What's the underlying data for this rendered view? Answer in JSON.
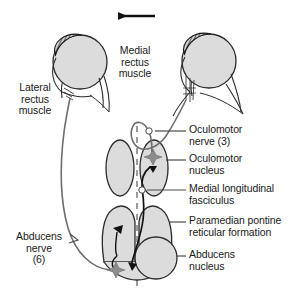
{
  "figure": {
    "gaze_direction_arrow": "leftward-arrow",
    "background_color": "#ffffff",
    "ink_color": "#1a1a1a",
    "structure_fill": "#dcdcdc",
    "structure_stroke": "#2b2b2b",
    "accent_marker_color": "#808080",
    "synapse_marker_color": "#111111"
  },
  "labels": {
    "lateral_rectus": "Lateral\nrectus\nmuscle",
    "medial_rectus": "Medial\nrectus\nmuscle",
    "oculomotor_nerve": "Oculomotor\nnerve (3)",
    "oculomotor_nucleus": "Oculomotor\nnucleus",
    "mlf": "Medial longitudinal\nfasciculus",
    "pprf": "Paramedian pontine\nreticular formation",
    "abducens_nucleus": "Abducens\nnucleus",
    "abducens_nerve": "Abducens\nnerve\n(6)"
  },
  "anatomy": {
    "eyes": [
      {
        "name": "left-eye",
        "side": "left",
        "cornea": "hatched-arc-upper-left"
      },
      {
        "name": "right-eye",
        "side": "right",
        "cornea": "hatched-arc-upper-left"
      }
    ],
    "nuclei": [
      {
        "name": "oculomotor-nucleus-left",
        "shape": "oval"
      },
      {
        "name": "oculomotor-nucleus-right",
        "shape": "oval",
        "marker": "star"
      },
      {
        "name": "pprf-left",
        "shape": "lobe",
        "marker": "star"
      },
      {
        "name": "pprf-right",
        "shape": "lobe"
      },
      {
        "name": "abducens-nucleus",
        "shape": "circle"
      }
    ],
    "midline": "vertical-dashed-line",
    "pathways": [
      "abducens-nerve-to-lateral-rectus",
      "mlf-ascending-to-oculomotor-nucleus",
      "oculomotor-nerve-to-medial-rectus",
      "pprf-to-abducens-nucleus"
    ]
  }
}
